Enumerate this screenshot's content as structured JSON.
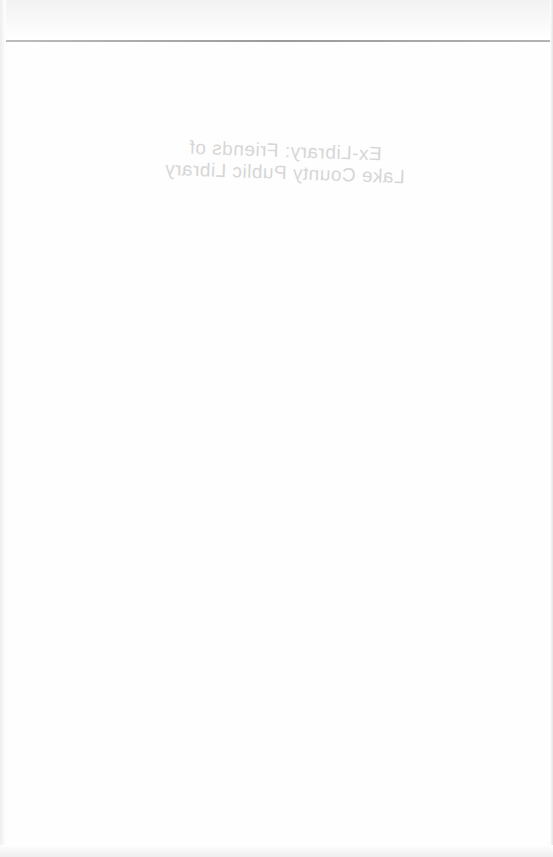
{
  "page": {
    "type": "scanned-book-page",
    "bleed_through_stamp": {
      "mirrored": true,
      "lines": [
        "Ex-Library: Friends of",
        "Lake County Public Library"
      ]
    }
  }
}
